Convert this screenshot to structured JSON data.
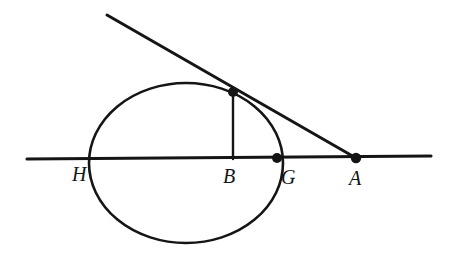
{
  "figure": {
    "background_color": "#ffffff",
    "ink_color": "#141414",
    "canvas": {
      "width": 451,
      "height": 261
    }
  },
  "labels": {
    "H": "H",
    "B": "B",
    "G": "G",
    "A": "A"
  },
  "geometry": {
    "circle": {
      "name": "main-circle",
      "center_x": 186,
      "center_y": 163,
      "radius_x": 97,
      "radius_y": 80,
      "stroke_width": 2.6
    },
    "horizontal_line": {
      "name": "secant-line",
      "x1": 27,
      "y1": 159,
      "x2": 431,
      "y2": 156,
      "stroke_width": 3.1
    },
    "tangent_line": {
      "name": "tangent-line",
      "x1": 107,
      "y1": 15,
      "x2": 356,
      "y2": 158,
      "stroke_width": 3.0
    },
    "perpendicular_segment": {
      "name": "perpendicular-segment",
      "x1": 233,
      "y1": 93,
      "x2": 233,
      "y2": 159,
      "stroke_width": 2.4
    },
    "points": [
      {
        "id": "T",
        "name": "tangency-point",
        "x": 233,
        "y": 92,
        "radius": 5.0,
        "labeled": false
      },
      {
        "id": "G",
        "name": "point-g",
        "x": 277,
        "y": 158,
        "radius": 5.0,
        "labeled": true
      },
      {
        "id": "A",
        "name": "point-a",
        "x": 356,
        "y": 158,
        "radius": 5.2,
        "labeled": true
      }
    ],
    "label_positions": {
      "H": {
        "x": 72,
        "y": 181
      },
      "B": {
        "x": 223,
        "y": 183
      },
      "G": {
        "x": 281,
        "y": 184
      },
      "A": {
        "x": 349,
        "y": 185
      }
    }
  }
}
